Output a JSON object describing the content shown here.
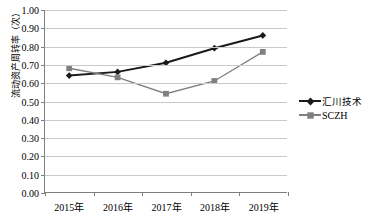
{
  "chart_data": {
    "type": "line",
    "title": "",
    "xlabel": "",
    "ylabel": "流动资产周转率（次）",
    "categories": [
      "2015年",
      "2016年",
      "2017年",
      "2018年",
      "2019年"
    ],
    "ylim": [
      0.0,
      1.0
    ],
    "ytick_step": 0.1,
    "ytick_labels": [
      "1.00",
      "0.90",
      "0.80",
      "0.70",
      "0.60",
      "0.50",
      "0.40",
      "0.30",
      "0.20",
      "0.10",
      "0.00"
    ],
    "ytick_values": [
      1.0,
      0.9,
      0.8,
      0.7,
      0.6,
      0.5,
      0.4,
      0.3,
      0.2,
      0.1,
      0.0
    ],
    "grid": true,
    "legend_position": "right",
    "series": [
      {
        "name": "汇川技术",
        "values": [
          0.64,
          0.66,
          0.71,
          0.79,
          0.86
        ],
        "color": "#1a1a1a",
        "marker": "diamond"
      },
      {
        "name": "SCZH",
        "values": [
          0.68,
          0.63,
          0.54,
          0.61,
          0.77
        ],
        "color": "#7f7f7f",
        "marker": "square"
      }
    ]
  },
  "axis": {
    "line_color": "#808080",
    "grid_color": "#c9c9c9"
  },
  "caption": {
    "text": ""
  }
}
